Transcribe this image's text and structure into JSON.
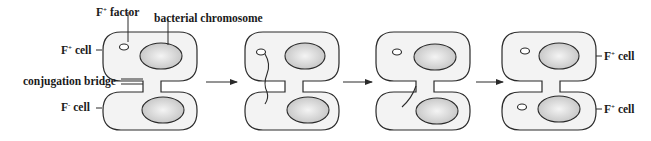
{
  "diagram": {
    "labels": {
      "f_factor": {
        "base": "F",
        "sup": "+",
        "rest": " factor"
      },
      "bacterial_chromosome": "bacterial chromosome",
      "f_plus_cell": {
        "base": "F",
        "sup": "+",
        "rest": " cell"
      },
      "conjugation_bridge": "conjugation bridge",
      "f_minus_cell": {
        "base": "F",
        "sup": "-",
        "rest": " cell"
      },
      "result_top": {
        "base": "F",
        "sup": "+",
        "rest": " cell"
      },
      "result_bottom": {
        "base": "F",
        "sup": "+",
        "rest": " cell"
      }
    },
    "stages": [
      {
        "id": 1,
        "description": "F+ cell with F factor joined to F- cell by conjugation bridge"
      },
      {
        "id": 2,
        "description": "F factor strand begins transferring through bridge"
      },
      {
        "id": 3,
        "description": "single strand transferred into recipient cell"
      },
      {
        "id": 4,
        "description": "both cells now F+ cells"
      }
    ],
    "arrows": 3,
    "colors": {
      "cell_fill": "#f3f3f3",
      "chromosome_fill": "#c8c8c8",
      "outline": "#2a2a2a"
    }
  }
}
